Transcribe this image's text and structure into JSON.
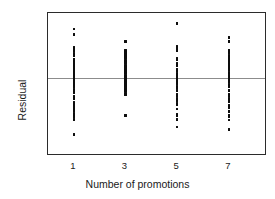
{
  "chart_data": {
    "type": "scatter",
    "title": "",
    "xlabel": "Number of promotions",
    "ylabel": "Residual",
    "xlim": [
      0,
      8.4
    ],
    "ylim": [
      -0.85,
      0.72
    ],
    "grid": false,
    "legend": "none",
    "annotations": [
      {
        "kind": "reference-line",
        "axis": "y",
        "value": 0
      }
    ],
    "x_ticks": [
      {
        "value": 1,
        "label": "1",
        "major": true
      },
      {
        "value": 2,
        "label": "",
        "major": false
      },
      {
        "value": 3,
        "label": "3",
        "major": true
      },
      {
        "value": 4,
        "label": "",
        "major": false
      },
      {
        "value": 5,
        "label": "5",
        "major": true
      },
      {
        "value": 6,
        "label": "",
        "major": false
      },
      {
        "value": 7,
        "label": "7",
        "major": true
      }
    ],
    "y_ticks": [
      {
        "value": 0.6,
        "label": "0.6"
      },
      {
        "value": 0.4,
        "label": "0.4"
      },
      {
        "value": 0.2,
        "label": "0.2"
      },
      {
        "value": 0.0,
        "label": "0"
      },
      {
        "value": -0.2,
        "label": "-0.2"
      },
      {
        "value": -0.4,
        "label": "-0.4"
      },
      {
        "value": -0.6,
        "label": "-0.6"
      },
      {
        "value": -0.8,
        "label": "-0.8"
      }
    ],
    "series": [
      {
        "name": "residuals",
        "marker": "square",
        "color": "#0d0d0d",
        "groups": [
          {
            "x": 1,
            "y": [
              0.54,
              0.48,
              0.34,
              0.33,
              0.32,
              0.31,
              0.3,
              0.27,
              0.25,
              0.24,
              0.21,
              0.2,
              0.19,
              0.18,
              0.17,
              0.15,
              0.14,
              0.13,
              0.12,
              0.11,
              0.1,
              0.09,
              0.08,
              0.06,
              0.05,
              0.04,
              0.03,
              0.02,
              0.01,
              0.0,
              -0.01,
              -0.02,
              -0.03,
              -0.04,
              -0.06,
              -0.07,
              -0.09,
              -0.1,
              -0.13,
              -0.14,
              -0.16,
              -0.17,
              -0.21,
              -0.23,
              -0.27,
              -0.28,
              -0.29,
              -0.3,
              -0.31,
              -0.32,
              -0.33,
              -0.34,
              -0.35,
              -0.36,
              -0.37,
              -0.4,
              -0.41,
              -0.43,
              -0.46,
              -0.47,
              -0.63
            ]
          },
          {
            "x": 3,
            "y": [
              0.4,
              0.3,
              0.29,
              0.28,
              0.27,
              0.26,
              0.24,
              0.23,
              0.22,
              0.19,
              0.18,
              0.17,
              0.14,
              0.13,
              0.12,
              0.11,
              0.1,
              0.08,
              0.07,
              0.06,
              0.05,
              0.03,
              0.02,
              0.01,
              0.0,
              -0.01,
              -0.02,
              -0.04,
              -0.05,
              -0.06,
              -0.07,
              -0.09,
              -0.1,
              -0.11,
              -0.13,
              -0.14,
              -0.15,
              -0.17,
              -0.18,
              -0.19,
              -0.42
            ]
          },
          {
            "x": 5,
            "y": [
              0.61,
              0.6,
              0.35,
              0.34,
              0.33,
              0.32,
              0.31,
              0.3,
              0.22,
              0.21,
              0.2,
              0.16,
              0.15,
              0.14,
              0.13,
              0.09,
              0.08,
              0.05,
              0.04,
              0.03,
              0.01,
              0.0,
              -0.01,
              -0.02,
              -0.03,
              -0.05,
              -0.06,
              -0.07,
              -0.1,
              -0.11,
              -0.14,
              -0.15,
              -0.19,
              -0.2,
              -0.23,
              -0.24,
              -0.25,
              -0.26,
              -0.29,
              -0.3,
              -0.35,
              -0.41,
              -0.42,
              -0.46,
              -0.47,
              -0.55
            ]
          },
          {
            "x": 7,
            "y": [
              0.45,
              0.44,
              0.41,
              0.4,
              0.31,
              0.3,
              0.29,
              0.28,
              0.25,
              0.24,
              0.23,
              0.22,
              0.2,
              0.19,
              0.18,
              0.17,
              0.15,
              0.14,
              0.13,
              0.11,
              0.1,
              0.09,
              0.06,
              0.05,
              0.04,
              0.02,
              0.01,
              0.0,
              -0.02,
              -0.03,
              -0.04,
              -0.07,
              -0.08,
              -0.09,
              -0.1,
              -0.14,
              -0.15,
              -0.19,
              -0.2,
              -0.23,
              -0.24,
              -0.25,
              -0.26,
              -0.27,
              -0.31,
              -0.32,
              -0.33,
              -0.37,
              -0.38,
              -0.42,
              -0.43,
              -0.47,
              -0.58
            ]
          }
        ]
      }
    ]
  }
}
